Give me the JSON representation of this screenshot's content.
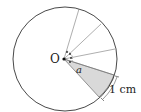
{
  "diagram": {
    "center_label": "O",
    "angle_label": "a",
    "arc_length_label": "1 cm",
    "colors": {
      "stroke": "#333333",
      "sector_fill": "#d9d9d9",
      "background": "#ffffff"
    },
    "sectors": 4,
    "shaded_sector": "bottom-right sector with arc length 1 cm"
  }
}
